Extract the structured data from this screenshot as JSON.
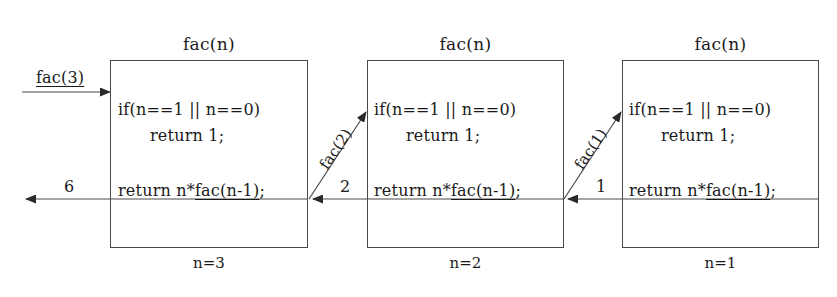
{
  "diagram": {
    "title_implicit": "Recursive factorial call/return trace",
    "code_lines": {
      "if_line": "if(n==1 || n==0)",
      "return_one": "return 1;",
      "recurse_prefix": "return n*",
      "recurse_call": "fac(n-1)",
      "recurse_suffix": ";"
    },
    "frames": [
      {
        "id": "frame-n3",
        "header": "fac(n)",
        "footer": "n=3",
        "x": 110,
        "y": 60,
        "width": 198,
        "height": 188
      },
      {
        "id": "frame-n2",
        "header": "fac(n)",
        "footer": "n=2",
        "x": 367,
        "y": 60,
        "width": 197,
        "height": 188
      },
      {
        "id": "frame-n1",
        "header": "fac(n)",
        "footer": "n=1",
        "x": 622,
        "y": 60,
        "width": 197,
        "height": 188
      }
    ],
    "call_arrows": [
      {
        "id": "entry-call",
        "label": "fac(3)",
        "kind": "horizontal",
        "direction": "right",
        "underlined": true
      },
      {
        "id": "call-fac2",
        "label": "fac(2)",
        "kind": "diagonal",
        "direction": "up-right",
        "angle_deg": -56
      },
      {
        "id": "call-fac1",
        "label": "fac(1)",
        "kind": "diagonal",
        "direction": "up-right",
        "angle_deg": -56
      }
    ],
    "return_arrows": [
      {
        "id": "return-6",
        "label": "6",
        "kind": "horizontal",
        "direction": "left"
      },
      {
        "id": "return-2",
        "label": "2",
        "kind": "horizontal",
        "direction": "left"
      },
      {
        "id": "return-1",
        "label": "1",
        "kind": "horizontal",
        "direction": "left"
      }
    ],
    "colors": {
      "ink": "#1a1a1a",
      "line": "#4a4a4a",
      "background": "#ffffff"
    }
  }
}
